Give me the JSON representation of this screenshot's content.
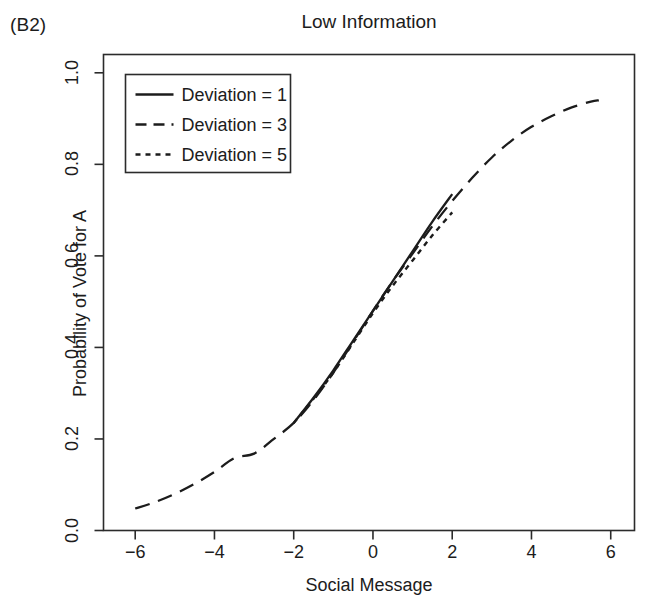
{
  "panel": {
    "label": "(B2)"
  },
  "chart_data": {
    "type": "line",
    "title": "Low Information",
    "xlabel": "Social Message",
    "ylabel": "Probability of Vote for A",
    "xlim": [
      -6.8,
      6.6
    ],
    "ylim": [
      0.0,
      1.04
    ],
    "xticks": [
      -6,
      -4,
      -2,
      0,
      2,
      4,
      6
    ],
    "xticklabels": [
      "−6",
      "−4",
      "−2",
      "0",
      "2",
      "4",
      "6"
    ],
    "yticks": [
      0.0,
      0.2,
      0.4,
      0.6,
      0.8,
      1.0
    ],
    "yticklabels": [
      "0.0",
      "0.2",
      "0.4",
      "0.6",
      "0.8",
      "1.0"
    ],
    "grid": false,
    "legend_position": "top-left",
    "series": [
      {
        "name": "Deviation = 1",
        "linestyle": "solid",
        "color": "#1c1c1c",
        "x": [
          -2.0,
          -1.5,
          -1.0,
          -0.5,
          0.0,
          0.5,
          1.0,
          1.5,
          2.0
        ],
        "y": [
          0.235,
          0.29,
          0.35,
          0.415,
          0.48,
          0.545,
          0.61,
          0.675,
          0.735
        ]
      },
      {
        "name": "Deviation = 3",
        "linestyle": "dashed",
        "color": "#1c1c1c",
        "x": [
          -6.0,
          -5.5,
          -5.0,
          -4.5,
          -4.0,
          -3.5,
          -3.0,
          -2.5,
          -2.0,
          -1.5,
          -1.0,
          -0.5,
          0.0,
          0.5,
          1.0,
          1.5,
          2.0,
          2.5,
          3.0,
          3.5,
          4.0,
          4.5,
          5.0,
          5.5,
          5.7
        ],
        "y": [
          0.048,
          0.062,
          0.08,
          0.102,
          0.128,
          0.158,
          0.168,
          0.2,
          0.235,
          0.285,
          0.345,
          0.412,
          0.48,
          0.545,
          0.605,
          0.665,
          0.72,
          0.77,
          0.815,
          0.852,
          0.882,
          0.905,
          0.924,
          0.937,
          0.94
        ]
      },
      {
        "name": "Deviation = 5",
        "linestyle": "dotted",
        "color": "#1c1c1c",
        "x": [
          -2.0,
          -1.5,
          -1.0,
          -0.5,
          0.0,
          0.5,
          1.0,
          1.5,
          2.0
        ],
        "y": [
          0.235,
          0.288,
          0.345,
          0.41,
          0.475,
          0.535,
          0.59,
          0.645,
          0.695
        ]
      }
    ]
  },
  "legend": {
    "items": [
      {
        "label": "Deviation = 1",
        "style": "solid"
      },
      {
        "label": "Deviation = 3",
        "style": "dashed"
      },
      {
        "label": "Deviation = 5",
        "style": "dotted"
      }
    ]
  }
}
